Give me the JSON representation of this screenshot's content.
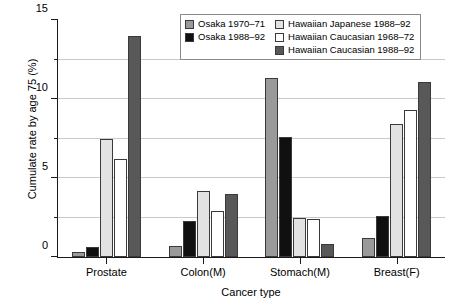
{
  "chart_data": {
    "type": "bar",
    "title": "",
    "xlabel": "Cancer type",
    "ylabel": "Cumulate rate by age 75 (%)",
    "categories": [
      "Prostate",
      "Colon(M)",
      "Stomach(M)",
      "Breast(F)"
    ],
    "ylim": [
      0,
      15
    ],
    "yticks": [
      0,
      5,
      10,
      15
    ],
    "ytick_labels": [
      "0",
      "5",
      "10",
      "15"
    ],
    "yminor_ticks": [
      2.5,
      7.5,
      12.5
    ],
    "gridlines": [
      2.5,
      5,
      7.5,
      10,
      12.5
    ],
    "grid": true,
    "legend_position": "top-right",
    "series": [
      {
        "name": "Osaka 1970–71",
        "color": "#9a9a9a",
        "values": [
          0.3,
          0.7,
          11.3,
          1.2
        ]
      },
      {
        "name": "Osaka 1988–92",
        "color": "#101010",
        "values": [
          0.65,
          2.3,
          7.6,
          2.6
        ]
      },
      {
        "name": "Hawaiian Japanese 1988–92",
        "color": "#e2e2e2",
        "values": [
          7.5,
          4.2,
          2.5,
          8.4
        ]
      },
      {
        "name": "Hawaiian Caucasian 1968–72",
        "color": "#ffffff",
        "values": [
          6.2,
          2.9,
          2.4,
          9.3
        ]
      },
      {
        "name": "Hawaiian Caucasian 1988–92",
        "color": "#585858",
        "values": [
          14.0,
          4.0,
          0.85,
          11.1
        ]
      }
    ]
  },
  "legend": {
    "columns": [
      [
        {
          "label": "Osaka 1970–71",
          "color": "#9a9a9a"
        },
        {
          "label": "Osaka 1988–92",
          "color": "#101010"
        }
      ],
      [
        {
          "label": "Hawaiian Japanese 1988–92",
          "color": "#e2e2e2"
        },
        {
          "label": "Hawaiian Caucasian 1968–72",
          "color": "#ffffff"
        },
        {
          "label": "Hawaiian Caucasian 1988–92",
          "color": "#585858"
        }
      ]
    ]
  }
}
